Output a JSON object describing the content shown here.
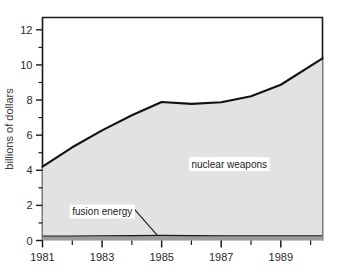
{
  "chart_data": {
    "type": "area",
    "title": "",
    "subtitle": "",
    "xlabel": "",
    "ylabel": "billions of dollars",
    "xlim": [
      1981,
      1990.4
    ],
    "ylim": [
      0,
      12.7
    ],
    "grid": false,
    "legend_position": "inline-annotation",
    "x_ticks_major": [
      "1981",
      "1983",
      "1985",
      "1987",
      "1989"
    ],
    "x_tick_values_major": [
      1981,
      1983,
      1985,
      1987,
      1989
    ],
    "x_tick_values_minor": [
      1982,
      1984,
      1986,
      1988,
      1990
    ],
    "y_ticks_major": [
      "0",
      "2",
      "4",
      "6",
      "8",
      "10",
      "12"
    ],
    "y_tick_values_major": [
      0,
      2,
      4,
      6,
      8,
      10,
      12
    ],
    "y_tick_values_minor": [
      1,
      3,
      5,
      7,
      9,
      11
    ],
    "stacked": true,
    "x": [
      1981,
      1982,
      1983,
      1984,
      1985,
      1986,
      1987,
      1988,
      1989,
      1990.4
    ],
    "series": [
      {
        "name": "fusion energy",
        "color": "#9b9b9b",
        "values": [
          0.26,
          0.26,
          0.27,
          0.28,
          0.29,
          0.28,
          0.27,
          0.27,
          0.27,
          0.27
        ]
      },
      {
        "name": "nuclear weapons",
        "color": "#e2e2e2",
        "values": [
          3.95,
          5.05,
          6.0,
          6.85,
          7.6,
          7.5,
          7.6,
          7.95,
          8.6,
          10.1
        ]
      }
    ],
    "annotations": [
      {
        "id": "nuclear-weapons-label",
        "text": "nuclear weapons",
        "x": 1986.0,
        "y": 4.15,
        "leader": false
      },
      {
        "id": "fusion-energy-label",
        "text": "fusion energy",
        "x": 1982.0,
        "y": 1.45,
        "leader": true,
        "leader_to_x": 1984.85,
        "leader_to_y": 0.3
      }
    ]
  },
  "colors": {
    "axis": "#1a1a1a",
    "line": "#111111",
    "nuclear_fill": "#e2e2e2",
    "fusion_fill": "#9b9b9b",
    "background": "#ffffff",
    "text": "#2b2b2b"
  },
  "axes": {
    "y_title": "billions of dollars",
    "y_tick_labels": [
      "0",
      "2",
      "4",
      "6",
      "8",
      "10",
      "12"
    ],
    "x_tick_labels": [
      "1981",
      "1983",
      "1985",
      "1987",
      "1989"
    ]
  },
  "labels": {
    "nuclear_weapons": "nuclear weapons",
    "fusion_energy": "fusion energy"
  }
}
